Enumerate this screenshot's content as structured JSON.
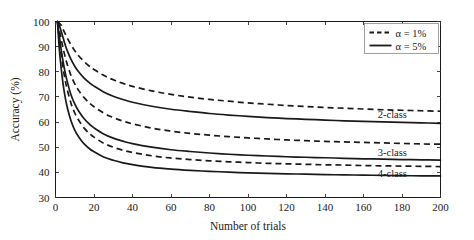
{
  "chart_data": {
    "type": "line",
    "title": "",
    "xlabel": "Number of trials",
    "ylabel": "Accuracy (%)",
    "xlim": [
      0,
      200
    ],
    "ylim": [
      30,
      100
    ],
    "xticks": [
      0,
      20,
      40,
      60,
      80,
      100,
      120,
      140,
      160,
      180,
      200
    ],
    "yticks": [
      30,
      40,
      50,
      60,
      70,
      80,
      90,
      100
    ],
    "grid": false,
    "legend_position": "top-right",
    "legend": [
      {
        "label": "α = 1%",
        "style": "dashed"
      },
      {
        "label": "α = 5%",
        "style": "solid"
      }
    ],
    "annotations": [
      {
        "text": "2-class",
        "x": 175,
        "y": 61.5
      },
      {
        "text": "3-class",
        "x": 175,
        "y": 46.5
      },
      {
        "text": "4-class",
        "x": 175,
        "y": 38.0
      }
    ],
    "x": [
      1,
      2,
      3,
      4,
      5,
      6,
      8,
      10,
      12,
      15,
      18,
      20,
      25,
      30,
      35,
      40,
      50,
      60,
      70,
      80,
      90,
      100,
      110,
      120,
      130,
      140,
      150,
      160,
      170,
      180,
      190,
      200
    ],
    "series": [
      {
        "name": "2-class, α = 1%",
        "group": "2-class",
        "alpha": "1%",
        "style": "dashed",
        "values": [
          100,
          99.4,
          98.4,
          96.8,
          95.2,
          93.6,
          90.8,
          88.4,
          86.4,
          84.0,
          82.0,
          80.9,
          78.6,
          76.8,
          75.4,
          74.2,
          72.4,
          71.0,
          69.9,
          69.0,
          68.3,
          67.6,
          67.1,
          66.6,
          66.2,
          65.8,
          65.5,
          65.2,
          64.9,
          64.7,
          64.5,
          64.3
        ]
      },
      {
        "name": "2-class, α = 5%",
        "group": "2-class",
        "alpha": "5%",
        "style": "solid",
        "values": [
          100,
          98.4,
          96.0,
          93.4,
          90.8,
          88.6,
          85.0,
          82.2,
          80.0,
          77.4,
          75.4,
          74.3,
          72.0,
          70.3,
          69.0,
          67.9,
          66.3,
          65.1,
          64.2,
          63.4,
          62.8,
          62.3,
          61.8,
          61.4,
          61.1,
          60.8,
          60.5,
          60.3,
          60.1,
          59.9,
          59.7,
          59.5
        ]
      },
      {
        "name": "3-class, α = 1%",
        "group": "3-class",
        "alpha": "1%",
        "style": "dashed",
        "values": [
          100,
          96.6,
          92.8,
          89.2,
          86.0,
          83.2,
          78.6,
          75.2,
          72.6,
          69.6,
          67.3,
          66.1,
          63.6,
          61.8,
          60.4,
          59.3,
          57.6,
          56.4,
          55.5,
          54.8,
          54.2,
          53.7,
          53.3,
          52.9,
          52.6,
          52.3,
          52.1,
          51.9,
          51.7,
          51.5,
          51.3,
          51.2
        ]
      },
      {
        "name": "3-class, α = 5%",
        "group": "3-class",
        "alpha": "5%",
        "style": "solid",
        "values": [
          100,
          94.0,
          88.6,
          83.8,
          79.8,
          76.4,
          71.0,
          67.2,
          64.4,
          61.2,
          58.9,
          57.7,
          55.3,
          53.6,
          52.4,
          51.4,
          50.0,
          49.0,
          48.3,
          47.7,
          47.2,
          46.8,
          46.5,
          46.2,
          46.0,
          45.8,
          45.6,
          45.4,
          45.3,
          45.1,
          45.0,
          44.9
        ]
      },
      {
        "name": "4-class, α = 1%",
        "group": "4-class",
        "alpha": "1%",
        "style": "dashed",
        "values": [
          100,
          93.0,
          86.6,
          81.2,
          76.8,
          73.2,
          67.6,
          63.6,
          60.8,
          57.5,
          55.2,
          54.0,
          51.6,
          50.0,
          48.8,
          47.9,
          46.6,
          45.7,
          45.1,
          44.6,
          44.2,
          43.9,
          43.6,
          43.4,
          43.2,
          43.0,
          42.9,
          42.7,
          42.6,
          42.5,
          42.4,
          42.3
        ]
      },
      {
        "name": "4-class, α = 5%",
        "group": "4-class",
        "alpha": "5%",
        "style": "solid",
        "values": [
          100,
          89.0,
          81.0,
          74.8,
          70.0,
          66.2,
          60.6,
          56.8,
          54.2,
          51.2,
          49.2,
          48.2,
          46.1,
          44.8,
          43.8,
          43.1,
          42.0,
          41.3,
          40.8,
          40.4,
          40.1,
          39.8,
          39.6,
          39.4,
          39.3,
          39.1,
          39.0,
          38.9,
          38.8,
          38.7,
          38.6,
          38.6
        ]
      }
    ]
  }
}
